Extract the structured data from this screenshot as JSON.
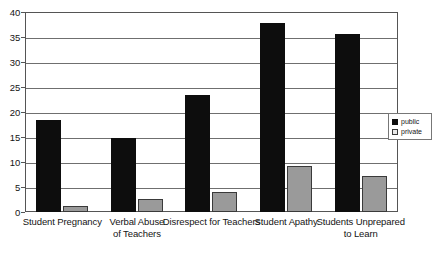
{
  "chart_data": {
    "type": "bar",
    "title": "",
    "xlabel": "",
    "ylabel": "",
    "ylim": [
      0,
      40
    ],
    "ytick_step": 5,
    "ytick_labels": [
      "0",
      "5",
      "10",
      "15",
      "20",
      "25",
      "30",
      "35",
      "40"
    ],
    "grid": true,
    "legend_position": "right",
    "categories": [
      "Student Pregnancy",
      "Verbal Abuse of Teachers",
      "Disrespect for Teachers",
      "Student Apathy",
      "Students Unprepared to Learn"
    ],
    "category_lines": [
      [
        "Student Pregnancy"
      ],
      [
        "Verbal Abuse",
        "of Teachers"
      ],
      [
        "Disrespect for Teachers"
      ],
      [
        "Student Apathy"
      ],
      [
        "Students Unprepared",
        "to Learn"
      ]
    ],
    "series": [
      {
        "name": "public",
        "color": "#0d0d0d",
        "values": [
          18.4,
          14.8,
          23.4,
          37.8,
          35.6
        ]
      },
      {
        "name": "private",
        "color": "#9a9a9a",
        "values": [
          1.2,
          2.6,
          4.0,
          9.3,
          7.2
        ]
      }
    ]
  },
  "legend": {
    "items": [
      {
        "label": "public",
        "swatch": "public-swatch-icon"
      },
      {
        "label": "private",
        "swatch": "private-swatch-icon"
      }
    ]
  },
  "colors": {
    "public": "#0d0d0d",
    "private": "#9a9a9a",
    "grid": "#6f6f6f",
    "frame": "#555555",
    "background": "#ffffff",
    "text": "#141414"
  }
}
